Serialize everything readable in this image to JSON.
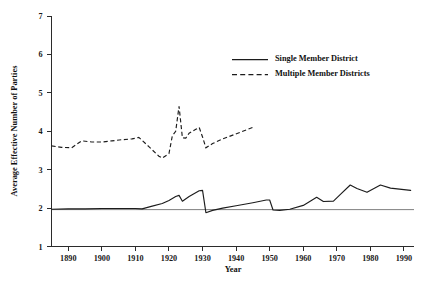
{
  "chart_data": {
    "type": "line",
    "title": "",
    "xlabel": "Year",
    "ylabel": "Average Effective Number of Parties",
    "xlim": [
      1885,
      1993
    ],
    "ylim": [
      1,
      7
    ],
    "xticks": [
      1890,
      1900,
      1910,
      1920,
      1930,
      1940,
      1950,
      1960,
      1970,
      1980,
      1990
    ],
    "yticks": [
      1,
      2,
      3,
      4,
      5,
      6,
      7
    ],
    "grid": false,
    "legend_position": "top-right",
    "series": [
      {
        "name": "Single Member District",
        "style": "solid",
        "color": "#1c1c1c",
        "x": [
          1885,
          1890,
          1895,
          1900,
          1906,
          1910,
          1912,
          1915,
          1918,
          1920,
          1922,
          1923,
          1924,
          1926,
          1929,
          1930,
          1931,
          1933,
          1936,
          1940,
          1945,
          1949,
          1950,
          1951,
          1953,
          1956,
          1960,
          1964,
          1966,
          1969,
          1971,
          1974,
          1976,
          1979,
          1983,
          1986,
          1990,
          1992
        ],
        "y": [
          1.97,
          1.98,
          1.98,
          1.99,
          1.99,
          1.99,
          1.98,
          2.05,
          2.12,
          2.2,
          2.3,
          2.33,
          2.18,
          2.3,
          2.45,
          2.46,
          1.88,
          1.94,
          2.0,
          2.06,
          2.14,
          2.21,
          2.21,
          1.95,
          1.94,
          1.97,
          2.07,
          2.28,
          2.17,
          2.18,
          2.35,
          2.6,
          2.51,
          2.41,
          2.6,
          2.52,
          2.48,
          2.46
        ]
      },
      {
        "name": "Multiple Member Districts",
        "style": "dashed",
        "color": "#1c1c1c",
        "x": [
          1885,
          1888,
          1891,
          1894,
          1897,
          1900,
          1903,
          1906,
          1909,
          1911,
          1914,
          1917,
          1918,
          1920,
          1921,
          1922,
          1923,
          1924,
          1925,
          1926,
          1928,
          1929,
          1930,
          1931,
          1933,
          1936,
          1939,
          1942,
          1945
        ],
        "y": [
          3.62,
          3.58,
          3.57,
          3.75,
          3.72,
          3.72,
          3.75,
          3.78,
          3.8,
          3.84,
          3.6,
          3.35,
          3.3,
          3.42,
          3.88,
          4.0,
          4.65,
          3.83,
          3.82,
          3.95,
          4.05,
          4.1,
          3.85,
          3.57,
          3.68,
          3.8,
          3.9,
          4.0,
          4.1
        ]
      }
    ],
    "baseline_reference": 1.96
  },
  "legend": {
    "items": [
      {
        "label": "Single Member District",
        "style": "solid"
      },
      {
        "label": "Multiple Member Districts",
        "style": "dashed"
      }
    ]
  },
  "axes": {
    "x_title": "Year",
    "y_title": "Average Effective Number of Parties"
  }
}
